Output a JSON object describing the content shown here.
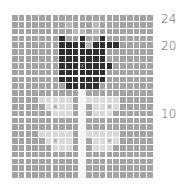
{
  "chart_data": {
    "type": "heatmap",
    "title": "",
    "columns": 21,
    "rows": 24,
    "row_labels": [
      {
        "label": "24",
        "row_from_top": 0
      },
      {
        "label": "20",
        "row_from_top": 4
      },
      {
        "label": "10",
        "row_from_top": 14
      }
    ],
    "legend": {
      "m": "background (mid gray)",
      "d": "flower (dark)",
      "l": "leaf (light gray)",
      "w": "stem (white)",
      "f": "faint highlight"
    },
    "colors": {
      "m": "#a3a3a3",
      "d": "#2e2e2e",
      "l": "#d9d9d9",
      "w": "#f4f4f4",
      "f": "#b8b8b8"
    },
    "grid": [
      "mmmmmmmmmmmmmmmmmmmmm",
      "mmmmmmmmfmmmfmmmmmmmm",
      "mmmmmmmmmffmfmmmmmmmm",
      "mmmmmmmdmmdmmdmmmmmmm",
      "mmmmmmmddddfddddmmmmm",
      "mmmmmmmdddddddmmmmmmm",
      "mmmmmmmdddddddmmmmmmm",
      "mmmmmmmdddXddddmmmmmm",
      "mmmmmmmdddddddmmmmmmm",
      "mmmmmmmdddddddmmmmmmm",
      "mmmmmmmmdddddmmmmmmmm",
      "mmmmmmmmmmwmmmmmmmmmm",
      "mmmmlllllmwlllllmmmmm",
      "mmmmmlYllmwmllYlmmmmm",
      "mmmmmmlllmwmlllmmmmmm",
      "mmmmmmmmmmwmmmmmmmmmm",
      "mmmmmmmmmmwmmmmmmmmmm",
      "mmmmlllllmwlllllmmmmm",
      "mmmmmlYllmwmllYlmmmmm",
      "mmmmmmlllmwmlllmmmmmm",
      "mmmmmmmmmmwmmmmmmmmmm",
      "mmmmmmmmmmwmmmmmmmmmm",
      "mmmmmmmmmmwmmmmmmmmmm",
      "mmmmmmmmmmwmmmmmmmmmm"
    ],
    "x_marks": [
      {
        "row": 7,
        "col": 10
      },
      {
        "row": 13,
        "col": 6
      },
      {
        "row": 13,
        "col": 14
      },
      {
        "row": 18,
        "col": 6
      },
      {
        "row": 18,
        "col": 14
      }
    ]
  }
}
